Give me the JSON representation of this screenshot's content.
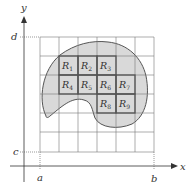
{
  "axes": {
    "x_label": "x",
    "y_label": "y",
    "x_ticks": [
      {
        "label": "a"
      },
      {
        "label": "b"
      }
    ],
    "y_ticks": [
      {
        "label": "d"
      },
      {
        "label": "c"
      }
    ]
  },
  "grid": {
    "columns": 6,
    "rows": 6
  },
  "region": {
    "fill": "#d9d9d9",
    "stroke": "#555555"
  },
  "subrectangles": [
    {
      "name": "R",
      "sub": "1"
    },
    {
      "name": "R",
      "sub": "2"
    },
    {
      "name": "R",
      "sub": "3"
    },
    {
      "name": "R",
      "sub": "4"
    },
    {
      "name": "R",
      "sub": "5"
    },
    {
      "name": "R",
      "sub": "6"
    },
    {
      "name": "R",
      "sub": "7"
    },
    {
      "name": "R",
      "sub": "8"
    },
    {
      "name": "R",
      "sub": "9"
    }
  ]
}
